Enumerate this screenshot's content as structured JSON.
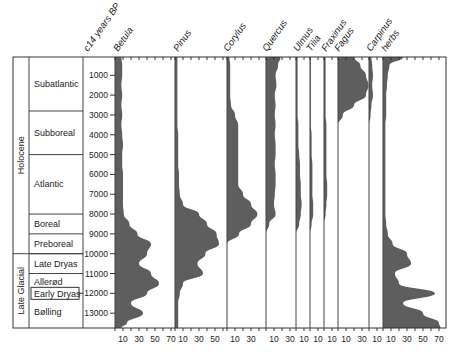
{
  "chart_data": {
    "type": "area",
    "ylabel": "c14 years BP",
    "y_ticks": [
      1000,
      2000,
      3000,
      4000,
      5000,
      6000,
      7000,
      8000,
      9000,
      10000,
      11000,
      12000,
      13000
    ],
    "ylim": [
      0,
      14000
    ],
    "periods": [
      {
        "name": "Holocene",
        "from": 0,
        "to": 10000
      },
      {
        "name": "Late Glacial",
        "from": 10000,
        "to": 14000
      }
    ],
    "zones": [
      {
        "name": "Subatlantic",
        "from": 0,
        "to": 2800
      },
      {
        "name": "Subboreal",
        "from": 2800,
        "to": 5000
      },
      {
        "name": "Atlantic",
        "from": 5000,
        "to": 8000
      },
      {
        "name": "Boreal",
        "from": 8000,
        "to": 9000
      },
      {
        "name": "Preboreal",
        "from": 9000,
        "to": 10000
      },
      {
        "name": "Late Dryas",
        "from": 10000,
        "to": 11000
      },
      {
        "name": "Allerød",
        "from": 11000,
        "to": 11900
      },
      {
        "name": "Early Dryas",
        "from": 11900,
        "to": 12100,
        "boxed": true
      },
      {
        "name": "Bølling",
        "from": 12100,
        "to": 14000
      }
    ],
    "depth_points": [
      0,
      500,
      1000,
      1500,
      2000,
      2500,
      3000,
      3500,
      4000,
      4500,
      5000,
      5500,
      6000,
      6500,
      7000,
      7500,
      8000,
      8500,
      9000,
      9500,
      10000,
      10500,
      11000,
      11500,
      12000,
      12500,
      13000,
      13500,
      14000
    ],
    "series": [
      {
        "name": "Betula",
        "x_ticks": [
          10,
          30,
          50,
          70
        ],
        "max": 75,
        "values": [
          8,
          9,
          9,
          8,
          9,
          8,
          9,
          8,
          9,
          10,
          9,
          9,
          10,
          10,
          10,
          10,
          11,
          18,
          28,
          45,
          40,
          30,
          45,
          55,
          40,
          20,
          35,
          15,
          8
        ]
      },
      {
        "name": "Pinus",
        "x_ticks": [
          10,
          30,
          50
        ],
        "max": 60,
        "values": [
          3,
          3,
          3,
          3,
          3,
          3,
          3,
          3,
          4,
          4,
          4,
          4,
          5,
          5,
          6,
          10,
          30,
          40,
          52,
          55,
          38,
          28,
          35,
          10,
          6,
          4,
          4,
          4,
          4
        ]
      },
      {
        "name": "Corylus",
        "x_ticks": [
          10,
          30
        ],
        "max": 35,
        "values": [
          3,
          4,
          4,
          4,
          4,
          5,
          10,
          14,
          14,
          14,
          14,
          14,
          14,
          14,
          20,
          30,
          38,
          30,
          15,
          0,
          0,
          0,
          0,
          0,
          0,
          0,
          0,
          0,
          0
        ]
      },
      {
        "name": "Quercus",
        "x_ticks": [
          10,
          30
        ],
        "max": 30,
        "values": [
          18,
          15,
          12,
          13,
          11,
          12,
          11,
          12,
          11,
          12,
          12,
          11,
          12,
          12,
          11,
          10,
          12,
          4,
          0,
          0,
          0,
          0,
          0,
          0,
          0,
          0,
          0,
          0,
          0
        ]
      },
      {
        "name": "Ulmus",
        "x_ticks": [
          10
        ],
        "max": 12,
        "values": [
          2,
          2,
          2,
          2,
          2,
          2,
          2,
          3,
          3,
          3,
          4,
          5,
          5,
          6,
          6,
          7,
          6,
          4,
          0,
          0,
          0,
          0,
          0,
          0,
          0,
          0,
          0,
          0,
          0
        ]
      },
      {
        "name": "Tilia",
        "x_ticks": [
          10
        ],
        "max": 12,
        "values": [
          1,
          1,
          1,
          1,
          1,
          1,
          1,
          1,
          2,
          2,
          2,
          3,
          3,
          3,
          3,
          4,
          4,
          2,
          0,
          0,
          0,
          0,
          0,
          0,
          0,
          0,
          0,
          0,
          0
        ]
      },
      {
        "name": "Fraxinus",
        "x_ticks": [
          10
        ],
        "max": 12,
        "values": [
          2,
          2,
          2,
          2,
          2,
          2,
          2,
          3,
          3,
          3,
          3,
          3,
          3,
          4,
          4,
          3,
          2,
          0,
          0,
          0,
          0,
          0,
          0,
          0,
          0,
          0,
          0,
          0,
          0
        ]
      },
      {
        "name": "Fagus",
        "x_ticks": [
          10,
          30
        ],
        "max": 40,
        "values": [
          20,
          28,
          35,
          38,
          35,
          20,
          6,
          0,
          0,
          0,
          0,
          0,
          0,
          0,
          0,
          0,
          0,
          0,
          0,
          0,
          0,
          0,
          0,
          0,
          0,
          0,
          0,
          0,
          0
        ]
      },
      {
        "name": "Carpinus",
        "x_ticks": [
          10
        ],
        "max": 12,
        "values": [
          3,
          4,
          5,
          4,
          5,
          3,
          2,
          0,
          0,
          0,
          0,
          0,
          0,
          0,
          0,
          0,
          0,
          0,
          0,
          0,
          0,
          0,
          0,
          0,
          0,
          0,
          0,
          0,
          0
        ]
      },
      {
        "name": "herbs",
        "x_ticks": [
          10,
          30,
          50,
          70
        ],
        "max": 80,
        "values": [
          25,
          8,
          6,
          5,
          4,
          4,
          4,
          3,
          3,
          3,
          3,
          3,
          3,
          3,
          3,
          3,
          3,
          4,
          6,
          12,
          30,
          35,
          15,
          20,
          65,
          25,
          50,
          70,
          72
        ]
      }
    ]
  },
  "labels": {
    "y_axis_title": "c14 years BP",
    "period_holocene": "Holocene",
    "period_late_glacial": "Late Glacial"
  }
}
